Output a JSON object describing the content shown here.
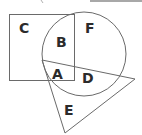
{
  "diagram": {
    "type": "venn-like region diagram",
    "shapes": {
      "rectangle": {
        "x": 9,
        "y": 14,
        "width": 65,
        "height": 66
      },
      "circle": {
        "cx": 84,
        "cy": 54,
        "r": 42
      },
      "triangle": {
        "points": "42,60 135,79 65,133"
      }
    },
    "regions": [
      {
        "id": "C",
        "label": "C",
        "x": 19,
        "y": 33
      },
      {
        "id": "B",
        "label": "B",
        "x": 56,
        "y": 47
      },
      {
        "id": "F",
        "label": "F",
        "x": 85,
        "y": 33
      },
      {
        "id": "A",
        "label": "A",
        "x": 52,
        "y": 79
      },
      {
        "id": "D",
        "label": "D",
        "x": 82,
        "y": 83
      },
      {
        "id": "E",
        "label": "E",
        "x": 64,
        "y": 115
      }
    ],
    "colors": {
      "stroke": "#6a6a6a",
      "label": "#2b2b2b",
      "background": "#ffffff"
    }
  }
}
